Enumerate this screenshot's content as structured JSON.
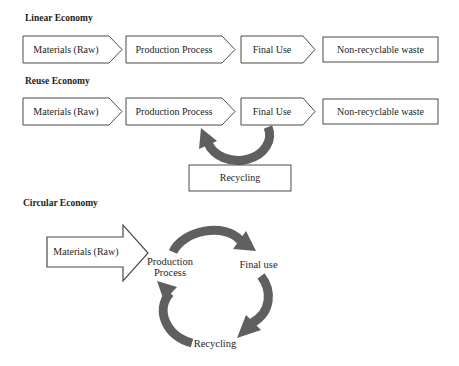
{
  "colors": {
    "arrow_gray": "#5f5f5f",
    "box_border": "#4b4b4b",
    "text": "#1e1e1e",
    "background": "#ffffff"
  },
  "linear": {
    "heading": "Linear Economy",
    "steps": [
      "Materials (Raw)",
      "Production Process",
      "Final Use",
      "Non-recyclable waste"
    ]
  },
  "reuse": {
    "heading": "Reuse Economy",
    "steps": [
      "Materials (Raw)",
      "Production Process",
      "Final Use",
      "Non-recyclable waste"
    ],
    "recycling_box": "Recycling"
  },
  "circular": {
    "heading": "Circular Economy",
    "input": "Materials (Raw)",
    "nodes": [
      "Production Process",
      "Final use",
      "Recycling"
    ]
  },
  "icons": {
    "reuse_return_arrow": "curved-arrow-up-left",
    "cycle_top_arrow": "curved-arrow-right",
    "cycle_right_arrow": "curved-arrow-down-left",
    "cycle_left_arrow": "curved-arrow-up"
  }
}
